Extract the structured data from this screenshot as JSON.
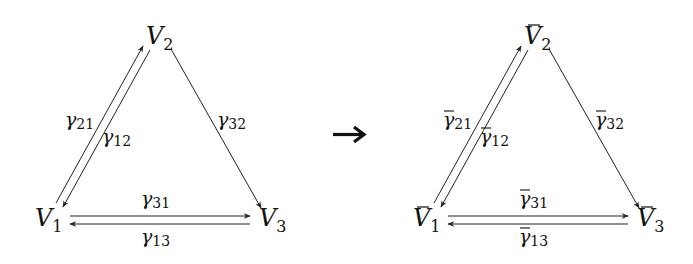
{
  "diagrams": [
    {
      "name": "original",
      "nodes": [
        {
          "id": "V1",
          "base": "V",
          "sub": "1",
          "bar": false
        },
        {
          "id": "V2",
          "base": "V",
          "sub": "2",
          "bar": false
        },
        {
          "id": "V3",
          "base": "V",
          "sub": "3",
          "bar": false
        }
      ],
      "edges": [
        {
          "from": "V1",
          "to": "V2",
          "label_base": "γ",
          "label_sub": "21",
          "bar": false
        },
        {
          "from": "V2",
          "to": "V1",
          "label_base": "γ",
          "label_sub": "12",
          "bar": false
        },
        {
          "from": "V2",
          "to": "V3",
          "label_base": "γ",
          "label_sub": "32",
          "bar": false
        },
        {
          "from": "V1",
          "to": "V3",
          "label_base": "γ",
          "label_sub": "31",
          "bar": false
        },
        {
          "from": "V3",
          "to": "V1",
          "label_base": "γ",
          "label_sub": "13",
          "bar": false
        }
      ]
    },
    {
      "name": "transformed",
      "nodes": [
        {
          "id": "V1bar",
          "base": "V",
          "sub": "1",
          "bar": true
        },
        {
          "id": "V2bar",
          "base": "V",
          "sub": "2",
          "bar": true
        },
        {
          "id": "V3bar",
          "base": "V",
          "sub": "3",
          "bar": true
        }
      ],
      "edges": [
        {
          "from": "V1bar",
          "to": "V2bar",
          "label_base": "γ",
          "label_sub": "21",
          "bar": true
        },
        {
          "from": "V2bar",
          "to": "V1bar",
          "label_base": "γ",
          "label_sub": "12",
          "bar": true
        },
        {
          "from": "V2bar",
          "to": "V3bar",
          "label_base": "γ",
          "label_sub": "32",
          "bar": true
        },
        {
          "from": "V1bar",
          "to": "V3bar",
          "label_base": "γ",
          "label_sub": "31",
          "bar": true
        },
        {
          "from": "V3bar",
          "to": "V1bar",
          "label_base": "γ",
          "label_sub": "13",
          "bar": true
        }
      ]
    }
  ],
  "transition_arrow": "→",
  "colors": {
    "stroke": "#222222",
    "text": "#111111",
    "background": "#ffffff"
  }
}
